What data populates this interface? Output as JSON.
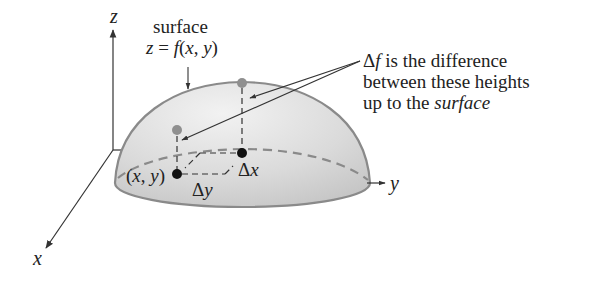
{
  "diagram": {
    "axes": {
      "x_label": "x",
      "y_label": "y",
      "z_label": "z"
    },
    "surface_label": {
      "line1": "surface",
      "line2_prefix": "z = ",
      "line2_func": "f",
      "line2_args": "(x, y)"
    },
    "annotation": {
      "delta": "Δ",
      "f": "f",
      "line1_rest": " is the difference",
      "line2": "between these heights",
      "line3_prefix": "up to the ",
      "line3_italic": "surface"
    },
    "point_label": "(x, y)",
    "delta_x": {
      "delta": "Δ",
      "var": "x"
    },
    "delta_y": {
      "delta": "Δ",
      "var": "y"
    },
    "colors": {
      "dome_fill": "#d4d4d4",
      "dome_edge": "#8a8a8a",
      "surface_dot": "#8f8f8f",
      "base_dot": "#111111",
      "axis": "#333333"
    }
  }
}
